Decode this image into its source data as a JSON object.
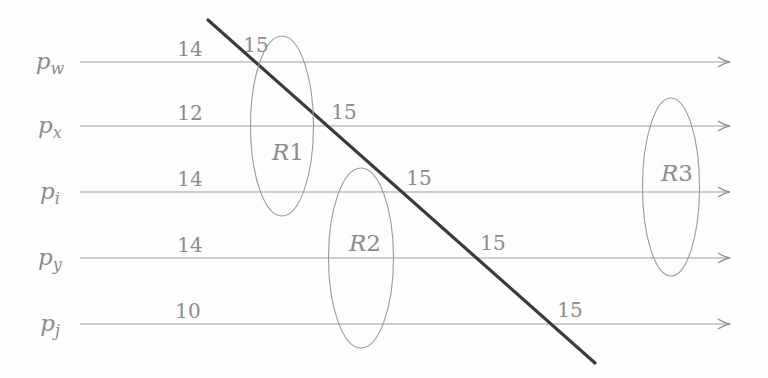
{
  "figure": {
    "type": "process-timeline-cut-diagram",
    "background": "#fdfdfd",
    "colors": {
      "timeline": "#9e9e9e",
      "region_outline": "#9a9a9a",
      "label_text": "#8c8c8c",
      "cut_line": "#3b3b3b"
    }
  },
  "processes": [
    {
      "base": "p",
      "sub": "w",
      "left_value": "14",
      "cut_value": "15"
    },
    {
      "base": "p",
      "sub": "x",
      "left_value": "12",
      "cut_value": "15"
    },
    {
      "base": "p",
      "sub": "i",
      "left_value": "14",
      "cut_value": "15"
    },
    {
      "base": "p",
      "sub": "y",
      "left_value": "14",
      "cut_value": "15"
    },
    {
      "base": "p",
      "sub": "j",
      "left_value": "10",
      "cut_value": "15"
    }
  ],
  "regions": [
    {
      "base": "R",
      "num": "1"
    },
    {
      "base": "R",
      "num": "2"
    },
    {
      "base": "R",
      "num": "3"
    }
  ]
}
